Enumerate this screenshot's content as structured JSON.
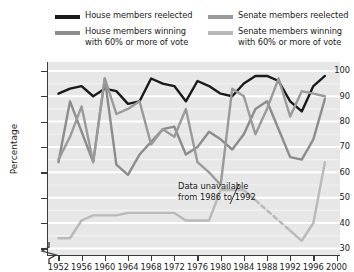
{
  "legend": {
    "items": [
      {
        "key": "house_reelected",
        "label": "House members reelected",
        "color": "#1a1a1a"
      },
      {
        "key": "house_60",
        "label": "House members winning\nwith 60% or more of vote",
        "color": "#8c8c8c"
      },
      {
        "key": "senate_reelected",
        "label": "Senate members reelected",
        "color": "#9a9a9a"
      },
      {
        "key": "senate_60",
        "label": "Senate members winning\nwith 60% or more of vote",
        "color": "#b9b9b9"
      }
    ]
  },
  "annotation": {
    "text": "Data unavailable\nfrom 1986 to 1992"
  },
  "chart_data": {
    "type": "line",
    "title": "",
    "xlabel": "",
    "ylabel": "Percentage",
    "xlim": [
      1950,
      2000
    ],
    "ylim": [
      28,
      104
    ],
    "grid": true,
    "axis_break_below": 30,
    "legend_position": "top",
    "x_ticks": [
      1952,
      1956,
      1960,
      1964,
      1968,
      1972,
      1976,
      1980,
      1984,
      1988,
      1992,
      1996,
      2000
    ],
    "y_ticks": [
      30,
      40,
      50,
      60,
      70,
      80,
      90,
      100
    ],
    "x": [
      1952,
      1954,
      1956,
      1958,
      1960,
      1962,
      1964,
      1966,
      1968,
      1970,
      1972,
      1974,
      1976,
      1978,
      1980,
      1982,
      1984,
      1986,
      1988,
      1990,
      1992,
      1994,
      1996,
      1998
    ],
    "series": [
      {
        "name": "House members reelected",
        "color": "#1a1a1a",
        "width": 2.4,
        "values": [
          91,
          93,
          94,
          90,
          93,
          92,
          87,
          88,
          97,
          95,
          94,
          88,
          96,
          94,
          91,
          90,
          95,
          98,
          98,
          96,
          88,
          84,
          94,
          98
        ]
      },
      {
        "name": "House members winning with 60% or more of vote",
        "color": "#8c8c8c",
        "width": 2.4,
        "values": [
          64,
          88,
          76,
          64,
          97,
          63,
          59,
          67,
          72,
          77,
          78,
          67,
          70,
          76,
          73,
          69,
          75,
          85,
          88,
          77,
          66,
          65,
          73,
          89
        ]
      },
      {
        "name": "Senate members reelected",
        "color": "#9a9a9a",
        "width": 2.4,
        "values": [
          65,
          74,
          86,
          64,
          97,
          83,
          85,
          88,
          71,
          77,
          74,
          85,
          64,
          60,
          55,
          93,
          90,
          75,
          85,
          97,
          82,
          92,
          91,
          90
        ]
      },
      {
        "name": "Senate members winning with 60% or more of vote",
        "color": "#b9b9b9",
        "width": 2.4,
        "dashed_from": 1986,
        "dashed_to": 1992,
        "values": [
          34,
          34,
          41,
          43,
          43,
          43,
          44,
          44,
          44,
          44,
          44,
          41,
          41,
          41,
          53,
          53,
          53,
          49,
          45,
          41,
          37,
          33,
          40,
          64
        ]
      }
    ]
  }
}
